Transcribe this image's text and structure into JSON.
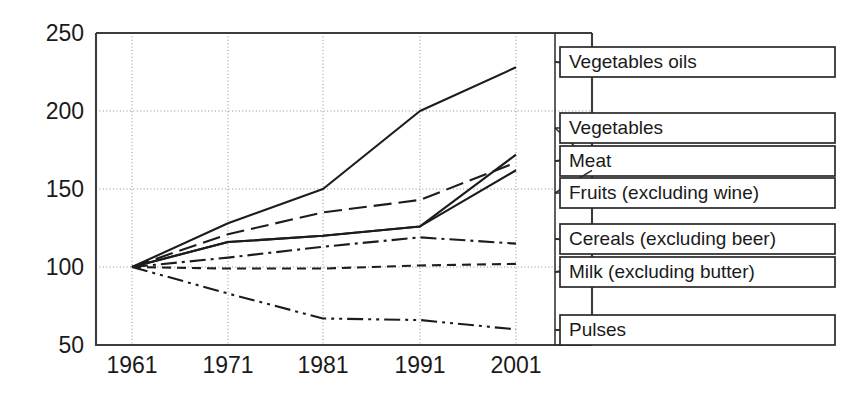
{
  "chart_data": {
    "type": "line",
    "title": "",
    "subtitle": "",
    "xlabel": "",
    "ylabel": "",
    "x": [
      1961,
      1971,
      1981,
      1991,
      2001
    ],
    "xticklabels": [
      "1961",
      "1971",
      "1981",
      "1991",
      "2001"
    ],
    "yticks": [
      50,
      100,
      150,
      200,
      250
    ],
    "yticklabels": [
      "50",
      "100",
      "150",
      "200",
      "250"
    ],
    "ylim": [
      50,
      250
    ],
    "xlim": [
      1958,
      2004
    ],
    "grid": true,
    "grid_axis": "both",
    "legend_position": "right-outside-boxed",
    "index_base": 100,
    "index_base_year": 1961,
    "series": [
      {
        "name": "Vegetables oils",
        "values": [
          100,
          128,
          150,
          200,
          228
        ],
        "dash": "solid",
        "color": "#1c1c1c"
      },
      {
        "name": "Vegetables",
        "values": [
          100,
          121,
          135,
          143,
          167
        ],
        "dash": "long-dash",
        "color": "#1c1c1c"
      },
      {
        "name": "Meat",
        "values": [
          100,
          116,
          120,
          126,
          172
        ],
        "dash": "solid",
        "color": "#1c1c1c"
      },
      {
        "name": "Fruits (excluding wine)",
        "values": [
          100,
          116,
          120,
          126,
          162
        ],
        "dash": "solid",
        "color": "#1c1c1c"
      },
      {
        "name": "Cereals (excluding beer)",
        "values": [
          100,
          106,
          113,
          119,
          115
        ],
        "dash": "dash-dot",
        "color": "#1c1c1c"
      },
      {
        "name": "Milk (excluding butter)",
        "values": [
          100,
          99,
          99,
          101,
          102
        ],
        "dash": "short-dash",
        "color": "#1c1c1c"
      },
      {
        "name": "Pulses",
        "values": [
          100,
          83,
          67,
          66,
          60
        ],
        "dash": "dash-dot-dot",
        "color": "#1c1c1c"
      }
    ]
  },
  "axes": {
    "y_tick_labels": [
      "250",
      "200",
      "150",
      "100",
      "50"
    ],
    "x_tick_labels": [
      "1961",
      "1971",
      "1981",
      "1991",
      "2001"
    ]
  },
  "legend": {
    "items": [
      {
        "label": "Vegetables oils"
      },
      {
        "label": "Vegetables"
      },
      {
        "label": "Meat"
      },
      {
        "label": "Fruits (excluding wine)"
      },
      {
        "label": "Cereals (excluding beer)"
      },
      {
        "label": "Milk (excluding butter)"
      },
      {
        "label": "Pulses"
      }
    ]
  },
  "colors": {
    "line": "#1c1c1c",
    "frame": "#3c3c3c",
    "grid": "#8c8c8c",
    "text": "#1a1a1a",
    "background": "#ffffff"
  }
}
